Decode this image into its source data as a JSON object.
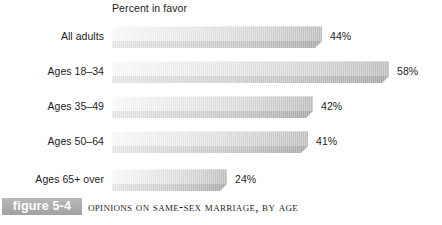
{
  "chart_data": {
    "type": "bar",
    "orientation": "horizontal",
    "title": "Percent in favor",
    "xlabel": "",
    "ylabel": "",
    "xlim": [
      0,
      62
    ],
    "grid": false,
    "legend": null,
    "categories": [
      "All adults",
      "Ages 18–34",
      "Ages 35–49",
      "Ages 50–64",
      "Ages 65+ over"
    ],
    "values": [
      44,
      58,
      42,
      41,
      24
    ],
    "value_labels": [
      "44%",
      "58%",
      "42%",
      "41%",
      "24%"
    ],
    "bars": [
      {
        "label": "All adults",
        "value": 44,
        "value_label": "44%"
      },
      {
        "label": "Ages 18–34",
        "value": 58,
        "value_label": "58%"
      },
      {
        "label": "Ages 35–49",
        "value": 42,
        "value_label": "42%"
      },
      {
        "label": "Ages 50–64",
        "value": 41,
        "value_label": "41%"
      },
      {
        "label": "Ages 65+ over",
        "value": 24,
        "value_label": "24%"
      }
    ]
  },
  "caption": {
    "figure_tag": "figure 5-4",
    "text": "Opinions on Same-Sex Marriage, by Age"
  },
  "colors": {
    "bar_light": "#fbfbfb",
    "bar_dark": "#bfbfbf",
    "bar_base_dark": "#a9a9a9",
    "tag_background": "#acacac",
    "tag_text": "#ffffff",
    "text": "#1c1c1c",
    "background": "#ffffff"
  }
}
